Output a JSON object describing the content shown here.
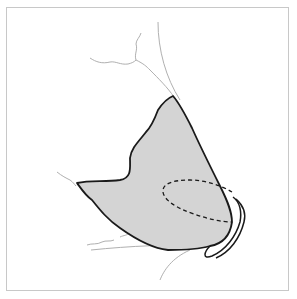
{
  "figure": {
    "type": "anatomical-line-drawing",
    "colors": {
      "fill": "#d4d4d4",
      "outline": "#1a1a1a",
      "faint_lines": "#b0b0b0",
      "frame_border": "#c8c8c8",
      "background": "#ffffff"
    },
    "elements": [
      {
        "name": "shaded-region",
        "description": "grey shaded region with dark outline"
      },
      {
        "name": "dashed-ellipse",
        "description": "dashed ellipse inside shaded region"
      },
      {
        "name": "nostril-loop",
        "description": "elongated loop outline at lower right"
      },
      {
        "name": "contour-lines",
        "description": "faint grey contour lines"
      }
    ]
  }
}
